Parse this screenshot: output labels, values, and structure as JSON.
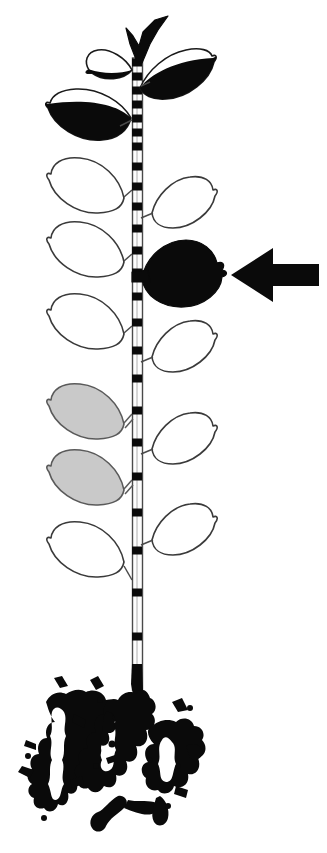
{
  "figure": {
    "background_color": "#ffffff",
    "width": 327,
    "height": 853,
    "caption": ""
  },
  "colors": {
    "ink": "#0a0a0a",
    "outline": "#3a3a3a",
    "gray_fill": "#c9c9c9",
    "white_fill": "#ffffff",
    "stem_fill": "#fdfdfd"
  },
  "stem": {
    "name": "main-stem",
    "x_left": 132,
    "x_right": 142,
    "y_top": 58,
    "y_bottom": 690,
    "base_solid_from_y": 668,
    "node_label": "leaf node",
    "node_positions": [
      62,
      76,
      90,
      104,
      118,
      132,
      146,
      166,
      186,
      206,
      228,
      250,
      272,
      296,
      322,
      350,
      378,
      410,
      442,
      476,
      512,
      550,
      592,
      636
    ],
    "node_width": 9,
    "node_height": 7
  },
  "apex": {
    "name": "apical-bud",
    "label": "apex",
    "fill": "#0a0a0a"
  },
  "arrow": {
    "name": "pointer-arrow",
    "label": "marker arrow",
    "direction": "left",
    "tip_x": 231,
    "tip_y": 275,
    "tail_x": 319,
    "shaft_half_height": 11,
    "head_half_height": 27,
    "head_length": 42,
    "color": "#0a0a0a",
    "points_to": "black-leaf-marked"
  },
  "leaves": [
    {
      "id": "leaf-apex-left",
      "label": "apex left leaf",
      "side": "left",
      "shade": "half-black",
      "node_y": 62
    },
    {
      "id": "leaf-apex-right",
      "label": "apex right leaf",
      "side": "right",
      "shade": "half-black",
      "node_y": 70
    },
    {
      "id": "leaf-upper-left",
      "label": "upper left leaf",
      "side": "left",
      "shade": "half-black",
      "node_y": 110
    },
    {
      "id": "leaf-mid-left-1",
      "label": "second left leaf",
      "side": "left",
      "shade": "white",
      "node_y": 186
    },
    {
      "id": "leaf-mid-right-1",
      "label": "second right leaf",
      "side": "right",
      "shade": "white",
      "node_y": 206
    },
    {
      "id": "leaf-mid-left-2",
      "label": "third left leaf",
      "side": "left",
      "shade": "white",
      "node_y": 250
    },
    {
      "id": "leaf-black-marked",
      "label": "marked black leaf",
      "side": "right",
      "shade": "black",
      "node_y": 272,
      "marked": true
    },
    {
      "id": "leaf-mid-left-3",
      "label": "fourth left leaf",
      "side": "left",
      "shade": "white",
      "node_y": 322
    },
    {
      "id": "leaf-mid-right-2",
      "label": "third right leaf",
      "side": "right",
      "shade": "white",
      "node_y": 350
    },
    {
      "id": "leaf-gray-1",
      "label": "first gray leaf",
      "side": "left",
      "shade": "gray",
      "node_y": 410
    },
    {
      "id": "leaf-mid-right-3",
      "label": "fourth right leaf",
      "side": "right",
      "shade": "white",
      "node_y": 442
    },
    {
      "id": "leaf-gray-2",
      "label": "second gray leaf",
      "side": "left",
      "shade": "gray",
      "node_y": 476
    },
    {
      "id": "leaf-lower-right",
      "label": "fifth right leaf",
      "side": "right",
      "shade": "white",
      "node_y": 512
    },
    {
      "id": "leaf-lower-left",
      "label": "fifth left leaf",
      "side": "left",
      "shade": "white",
      "node_y": 550
    }
  ],
  "roots": {
    "name": "root-system",
    "label": "root mass",
    "x_min": 18,
    "x_max": 192,
    "y_min": 666,
    "y_max": 842,
    "color": "#0a0a0a",
    "style": "ink-blot"
  }
}
